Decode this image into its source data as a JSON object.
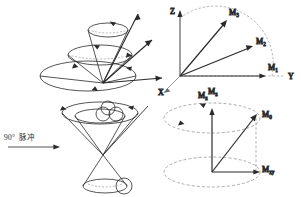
{
  "figure": {
    "title": "",
    "background_color": "#ffffff",
    "ink_color": "#2a2a2a",
    "dash_color": "#6b6b6b"
  },
  "annotation": {
    "pulse_degrees": "90°",
    "pulse_label_cn": "脉冲",
    "arrow_icon": "right-arrow-icon"
  },
  "panels": {
    "top_left": {
      "name": "precession-cones-panel",
      "description": "nested precession cones with magnetization vectors",
      "cone_count": 3,
      "vector_count": 3
    },
    "top_right": {
      "name": "coordinate-vectors-panel",
      "axes": [
        {
          "label": "Z",
          "direction": "up"
        },
        {
          "label": "Y",
          "direction": "right"
        },
        {
          "label": "X",
          "direction": "lower-left"
        }
      ],
      "vectors": [
        {
          "label": "M",
          "sub": "3"
        },
        {
          "label": "M",
          "sub": "2"
        },
        {
          "label": "M",
          "sub": "1"
        }
      ],
      "bottom_label": {
        "label": "M",
        "sub": "z"
      }
    },
    "bottom_left": {
      "name": "double-cone-panel",
      "description": "double cone (hourglass) with spin spheres after 90 degree pulse",
      "sphere_count": 4
    },
    "bottom_right": {
      "name": "magnetization-components-panel",
      "labels": [
        {
          "label": "M",
          "sub": "z"
        },
        {
          "label": "M",
          "sub": "0"
        },
        {
          "label": "M",
          "sub": "xy"
        }
      ],
      "ellipse_count": 2
    }
  }
}
